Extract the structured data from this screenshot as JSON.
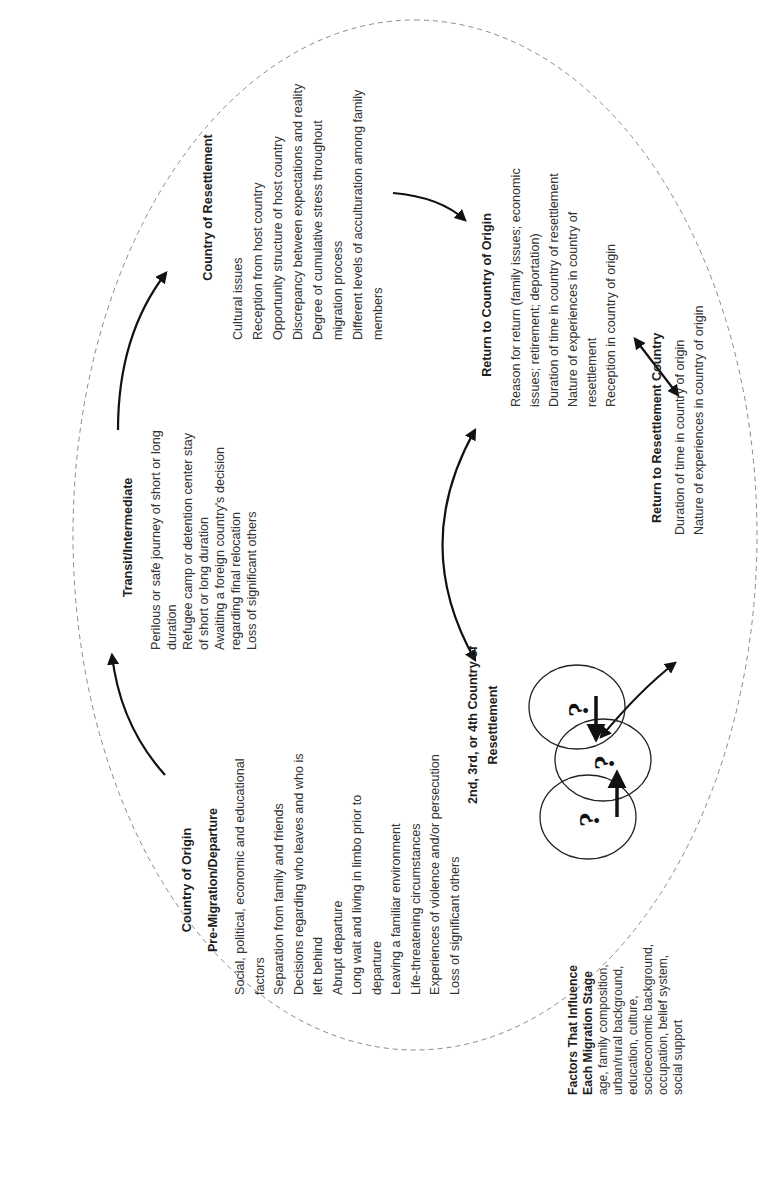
{
  "diagram": {
    "orientation": "rotated 90 degrees counter-clockwise",
    "stages": [
      {
        "id": "country-of-origin",
        "title": [
          "Country of Origin",
          "Pre-Migration/Departure"
        ],
        "items": [
          "Social, political, economic and educational factors",
          "Separation from family and friends",
          "Decisions regarding who leaves and who is left behind",
          "Abrupt departure",
          "Long wait and living in limbo prior to departure",
          "Leaving a familiar environment",
          "Life-threatening circumstances",
          "Experiences of violence and/or persecution",
          "Loss of significant others"
        ]
      },
      {
        "id": "transit",
        "title": [
          "Transit/Intermediate"
        ],
        "items": [
          "Perilous or safe journey of short or long duration",
          "Refugee camp or detention center stay of short or long duration",
          "Awaiting a foreign country's decision regarding final relocation",
          "Loss of significant others"
        ]
      },
      {
        "id": "country-of-resettlement",
        "title": [
          "Country of Resettlement"
        ],
        "items": [
          "Cultural issues",
          "Reception from host country",
          "Opportunity structure of host country",
          "Discrepancy between expectations and reality",
          "Degree of cumulative stress throughout migration process",
          "Different levels of acculturation among family members"
        ]
      },
      {
        "id": "return-to-origin",
        "title": [
          "Return to Country of Origin"
        ],
        "items": [
          "Reason for return (family issues; economic issues; retirement; deportation)",
          "Duration of time in country of resettlement",
          "Nature of experiences in country of resettlement",
          "Reception in country of origin"
        ]
      },
      {
        "id": "return-to-resettlement",
        "title": [
          "Return to Resettlement Country"
        ],
        "items": [
          "Duration of time in country of origin",
          "Nature of experiences in country of origin"
        ]
      },
      {
        "id": "nth-resettlement",
        "title": [
          "2nd, 3rd, or 4th Country of",
          "Resettlement"
        ],
        "items": []
      }
    ],
    "circles": {
      "count": 3,
      "symbol": "?"
    },
    "factors": {
      "title": [
        "Factors That Influence",
        "Each Migration Stage"
      ],
      "lines": [
        "age, family composition,",
        "urban/rural background,",
        "education, culture,",
        "socioeconomic background,",
        "occupation, belief system,",
        "social support"
      ]
    },
    "colors": {
      "text": "#333333",
      "title": "#1e1e1e",
      "arrow": "#111111",
      "dashed_ellipse": "#888888",
      "background": "#ffffff"
    }
  }
}
